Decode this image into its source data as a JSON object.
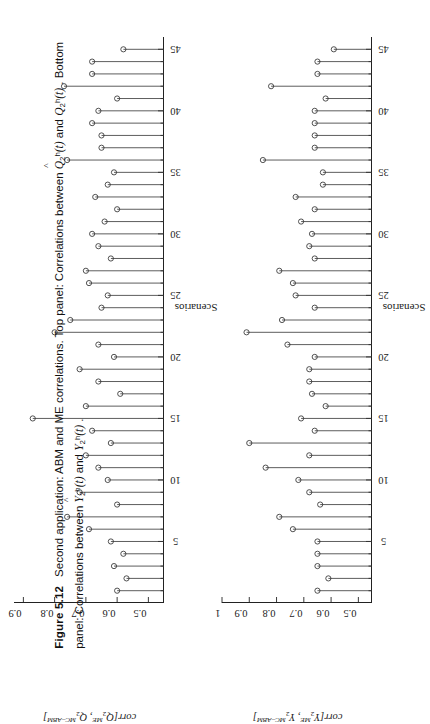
{
  "figure": {
    "number": "Figure 5.12",
    "caption_line1": "Second application: ABM and ME correlations. Top panel: Correlations between",
    "caption_line2": "panel: Correlations between",
    "caption_top_sym_a": "Q",
    "caption_top_sym_b": "Q",
    "caption_word_and": "and",
    "caption_word_bottom": ". Bottom",
    "caption_bot_sym_a": "Y",
    "caption_bot_sym_b": "Y",
    "caption_tail": "."
  },
  "axes": {
    "xlabel": "Scenarios",
    "xticks": [
      5,
      10,
      15,
      20,
      25,
      30,
      35,
      40,
      45
    ],
    "xlim": [
      0,
      46
    ],
    "top_ylabel_prefix": "corr[",
    "top_ylabel_suffix": "]",
    "bottom_ylabel_prefix": "corr[",
    "bottom_ylabel_suffix": "]"
  },
  "chart_data": [
    {
      "type": "line",
      "panel": "top",
      "title": "",
      "subtype": "stem",
      "xlabel": "Scenarios",
      "ylabel": "corr[Q_2^ME, Q_2^{MC-ABM}]",
      "xlim": [
        0,
        46
      ],
      "ylim": [
        0.45,
        0.93
      ],
      "yticks": [
        0.5,
        0.6,
        0.7,
        0.8,
        0.9
      ],
      "ytick_labels": [
        "0.5",
        "0.6",
        "0.7",
        "0.8",
        "0.9"
      ],
      "xticks": [
        5,
        10,
        15,
        20,
        25,
        30,
        35,
        40,
        45
      ],
      "grid": false,
      "legend": "none",
      "marker": "open-circle",
      "baseline": 0.45,
      "x": [
        1,
        2,
        3,
        4,
        5,
        6,
        7,
        8,
        9,
        10,
        11,
        12,
        13,
        14,
        15,
        16,
        17,
        18,
        19,
        20,
        21,
        22,
        23,
        24,
        25,
        26,
        27,
        28,
        29,
        30,
        31,
        32,
        33,
        34,
        35,
        36,
        37,
        38,
        39,
        40,
        41,
        42,
        43,
        44,
        45
      ],
      "values": [
        0.6,
        0.57,
        0.61,
        0.58,
        0.62,
        0.69,
        0.76,
        0.6,
        0.72,
        0.63,
        0.66,
        0.7,
        0.62,
        0.68,
        0.87,
        0.7,
        0.59,
        0.66,
        0.72,
        0.61,
        0.66,
        0.8,
        0.75,
        0.65,
        0.63,
        0.69,
        0.7,
        0.62,
        0.66,
        0.68,
        0.64,
        0.6,
        0.67,
        0.63,
        0.61,
        0.76,
        0.65,
        0.65,
        0.68,
        0.66,
        0.6,
        0.77,
        0.68,
        0.68,
        0.58
      ]
    },
    {
      "type": "line",
      "panel": "bottom",
      "title": "",
      "subtype": "stem",
      "xlabel": "Scenarios",
      "ylabel": "corr[Y_2^ME, Y_2^{MC-ABM}]",
      "xlim": [
        0,
        46
      ],
      "ylim": [
        0.45,
        1.0
      ],
      "yticks": [
        0.5,
        0.6,
        0.7,
        0.8,
        0.9,
        1.0
      ],
      "ytick_labels": [
        "0.5",
        "0.6",
        "0.7",
        "0.8",
        "0.9",
        "1"
      ],
      "xticks": [
        5,
        10,
        15,
        20,
        25,
        30,
        35,
        40,
        45
      ],
      "grid": false,
      "legend": "none",
      "marker": "open-circle",
      "baseline": 0.45,
      "x": [
        1,
        2,
        3,
        4,
        5,
        6,
        7,
        8,
        9,
        10,
        11,
        12,
        13,
        14,
        15,
        16,
        17,
        18,
        19,
        20,
        21,
        22,
        23,
        24,
        25,
        26,
        27,
        28,
        29,
        30,
        31,
        32,
        33,
        34,
        35,
        36,
        37,
        38,
        39,
        40,
        41,
        42,
        43,
        44,
        45
      ],
      "values": [
        0.65,
        0.61,
        0.65,
        0.65,
        0.65,
        0.74,
        0.79,
        0.64,
        0.68,
        0.72,
        0.84,
        0.68,
        0.9,
        0.66,
        0.71,
        0.62,
        0.67,
        0.68,
        0.68,
        0.66,
        0.76,
        0.91,
        0.78,
        0.66,
        0.73,
        0.74,
        0.79,
        0.66,
        0.68,
        0.67,
        0.71,
        0.66,
        0.73,
        0.63,
        0.63,
        0.85,
        0.66,
        0.66,
        0.66,
        0.66,
        0.62,
        0.82,
        0.65,
        0.65,
        0.59
      ]
    }
  ]
}
